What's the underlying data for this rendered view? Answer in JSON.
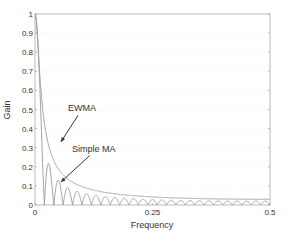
{
  "chart_data": {
    "type": "line",
    "title": "",
    "xlabel": "Frequency",
    "ylabel": "Gain",
    "xlim": [
      0,
      0.5
    ],
    "ylim": [
      0,
      1
    ],
    "xticks": [
      "0",
      "0.25",
      "0.5"
    ],
    "xtick_values": [
      0,
      0.25,
      0.5
    ],
    "yticks": [
      "0",
      "0.1",
      "0.2",
      "0.3",
      "0.4",
      "0.5",
      "0.6",
      "0.7",
      "0.8",
      "0.9",
      "1"
    ],
    "ytick_values": [
      0,
      0.1,
      0.2,
      0.3,
      0.4,
      0.5,
      0.6,
      0.7,
      0.8,
      0.9,
      1
    ],
    "grid": true,
    "series": [
      {
        "name": "EWMA",
        "model": "ewma",
        "alpha": 0.058
      },
      {
        "name": "Simple MA",
        "model": "moving_average",
        "window": 50
      }
    ],
    "annotations": [
      {
        "text": "EWMA",
        "x": 0.1,
        "y": 0.49,
        "arrow_to": [
          0.055,
          0.33
        ]
      },
      {
        "text": "Simple MA",
        "x": 0.125,
        "y": 0.28,
        "arrow_to": [
          0.055,
          0.12
        ]
      }
    ],
    "color": "#999999"
  }
}
